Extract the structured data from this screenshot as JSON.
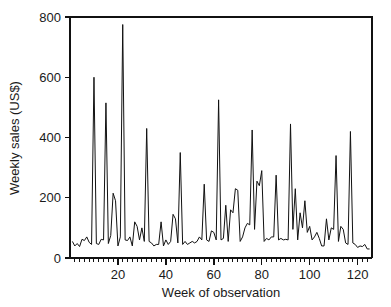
{
  "chart_data": {
    "type": "line",
    "title": "",
    "subtitle": "",
    "xlabel": "Week of observation",
    "ylabel": "Weekly sales (US$)",
    "xlim": [
      0,
      126
    ],
    "ylim": [
      0,
      800
    ],
    "grid": false,
    "legend": null,
    "legend_position": "none",
    "line_color": "#111111",
    "background_color": "#ffffff",
    "x_ticks_major": [
      20,
      40,
      60,
      80,
      100,
      120
    ],
    "x_tick_labels": [
      "20",
      "40",
      "60",
      "80",
      "100",
      "120"
    ],
    "x_minor_tick_step": 2,
    "y_ticks_major": [
      0,
      200,
      400,
      600,
      800
    ],
    "y_tick_labels": [
      "0",
      "200",
      "400",
      "600",
      "800"
    ],
    "series": [
      {
        "name": "Weekly sales",
        "x": [
          1,
          2,
          3,
          4,
          5,
          6,
          7,
          8,
          9,
          10,
          11,
          12,
          13,
          14,
          15,
          16,
          17,
          18,
          19,
          20,
          21,
          22,
          23,
          24,
          25,
          26,
          27,
          28,
          29,
          30,
          31,
          32,
          33,
          34,
          35,
          36,
          37,
          38,
          39,
          40,
          41,
          42,
          43,
          44,
          45,
          46,
          47,
          48,
          49,
          50,
          51,
          52,
          53,
          54,
          55,
          56,
          57,
          58,
          59,
          60,
          61,
          62,
          63,
          64,
          65,
          66,
          67,
          68,
          69,
          70,
          71,
          72,
          73,
          74,
          75,
          76,
          77,
          78,
          79,
          80,
          81,
          82,
          83,
          84,
          85,
          86,
          87,
          88,
          89,
          90,
          91,
          92,
          93,
          94,
          95,
          96,
          97,
          98,
          99,
          100,
          101,
          102,
          103,
          104,
          105,
          106,
          107,
          108,
          109,
          110,
          111,
          112,
          113,
          114,
          115,
          116,
          117,
          118,
          119,
          120,
          121,
          122,
          123,
          124,
          125
        ],
        "values": [
          55,
          40,
          48,
          38,
          62,
          58,
          70,
          52,
          45,
          600,
          48,
          45,
          62,
          60,
          515,
          48,
          75,
          215,
          190,
          40,
          70,
          775,
          60,
          58,
          70,
          40,
          120,
          105,
          60,
          100,
          55,
          430,
          55,
          50,
          40,
          45,
          45,
          120,
          40,
          60,
          45,
          55,
          145,
          130,
          50,
          350,
          45,
          55,
          45,
          50,
          55,
          50,
          55,
          70,
          60,
          245,
          60,
          55,
          90,
          85,
          60,
          525,
          60,
          65,
          175,
          55,
          160,
          150,
          230,
          225,
          55,
          70,
          100,
          115,
          110,
          425,
          95,
          255,
          240,
          290,
          55,
          65,
          60,
          70,
          70,
          275,
          60,
          65,
          60,
          62,
          60,
          445,
          95,
          230,
          60,
          150,
          100,
          190,
          85,
          105,
          60,
          70,
          85,
          65,
          40,
          40,
          130,
          60,
          100,
          95,
          340,
          55,
          105,
          95,
          50,
          45,
          420,
          50,
          45,
          35,
          40,
          38,
          45,
          30,
          30
        ]
      }
    ]
  },
  "axes": {
    "y_label": "Weekly sales (US$)",
    "x_label": "Week of observation"
  }
}
